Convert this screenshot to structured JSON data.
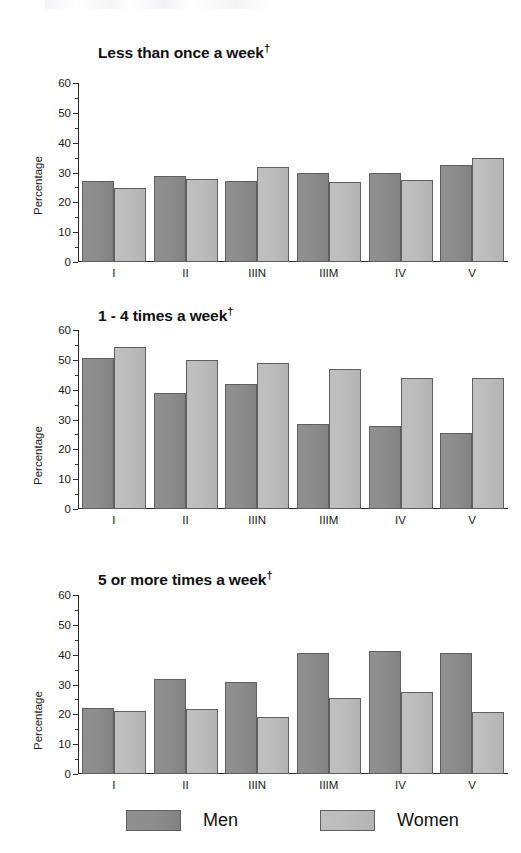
{
  "figure": {
    "y_axis_label": "Percentage",
    "categories": [
      "I",
      "II",
      "IIIN",
      "IIIM",
      "IV",
      "V"
    ],
    "y_ticks": [
      0,
      10,
      20,
      30,
      40,
      50,
      60
    ],
    "y_min": 0,
    "y_max": 60,
    "dagger": "†",
    "colors": {
      "men": "#8d8d8d",
      "women": "#bcbcbc",
      "bar_border": "#5f5f5f",
      "axis": "#2a2a2a",
      "background": "#ffffff",
      "text": "#1a1a1a"
    }
  },
  "legend": {
    "position": "bottom",
    "items": [
      {
        "label": "Men",
        "swatch": "men-swatch"
      },
      {
        "label": "Women",
        "swatch": "women-swatch"
      }
    ]
  },
  "chart_data": [
    {
      "type": "bar",
      "title": "Less than once a week†",
      "title_text": "Less than once a week",
      "xlabel": "",
      "ylabel": "Percentage",
      "ylim": [
        0,
        60
      ],
      "yticks": [
        0,
        10,
        20,
        30,
        40,
        50,
        60
      ],
      "grid": false,
      "legend_position": "figure-bottom",
      "categories": [
        "I",
        "II",
        "IIIN",
        "IIIM",
        "IV",
        "V"
      ],
      "series": [
        {
          "name": "Men",
          "values": [
            27.0,
            28.7,
            27.0,
            29.9,
            29.8,
            32.5
          ]
        },
        {
          "name": "Women",
          "values": [
            24.9,
            27.8,
            31.8,
            26.8,
            27.5,
            34.8
          ]
        }
      ]
    },
    {
      "type": "bar",
      "title": "1 - 4 times a week†",
      "title_text": "1 - 4 times a week",
      "xlabel": "",
      "ylabel": "Percentage",
      "ylim": [
        0,
        60
      ],
      "yticks": [
        0,
        10,
        20,
        30,
        40,
        50,
        60
      ],
      "grid": false,
      "legend_position": "figure-bottom",
      "categories": [
        "I",
        "II",
        "IIIN",
        "IIIM",
        "IV",
        "V"
      ],
      "series": [
        {
          "name": "Men",
          "values": [
            50.7,
            39.0,
            42.0,
            28.6,
            27.8,
            25.6
          ]
        },
        {
          "name": "Women",
          "values": [
            54.2,
            49.8,
            49.0,
            46.8,
            43.8,
            43.8
          ]
        }
      ]
    },
    {
      "type": "bar",
      "title": "5 or more times a week†",
      "title_text": "5 or more times a week",
      "xlabel": "",
      "ylabel": "Percentage",
      "ylim": [
        0,
        60
      ],
      "yticks": [
        0,
        10,
        20,
        30,
        40,
        50,
        60
      ],
      "grid": false,
      "legend_position": "figure-bottom",
      "categories": [
        "I",
        "II",
        "IIIN",
        "IIIM",
        "IV",
        "V"
      ],
      "series": [
        {
          "name": "Men",
          "values": [
            22.0,
            32.0,
            30.8,
            40.7,
            41.4,
            40.6
          ]
        },
        {
          "name": "Women",
          "values": [
            21.1,
            21.8,
            19.0,
            25.5,
            27.5,
            20.9
          ]
        }
      ]
    }
  ]
}
